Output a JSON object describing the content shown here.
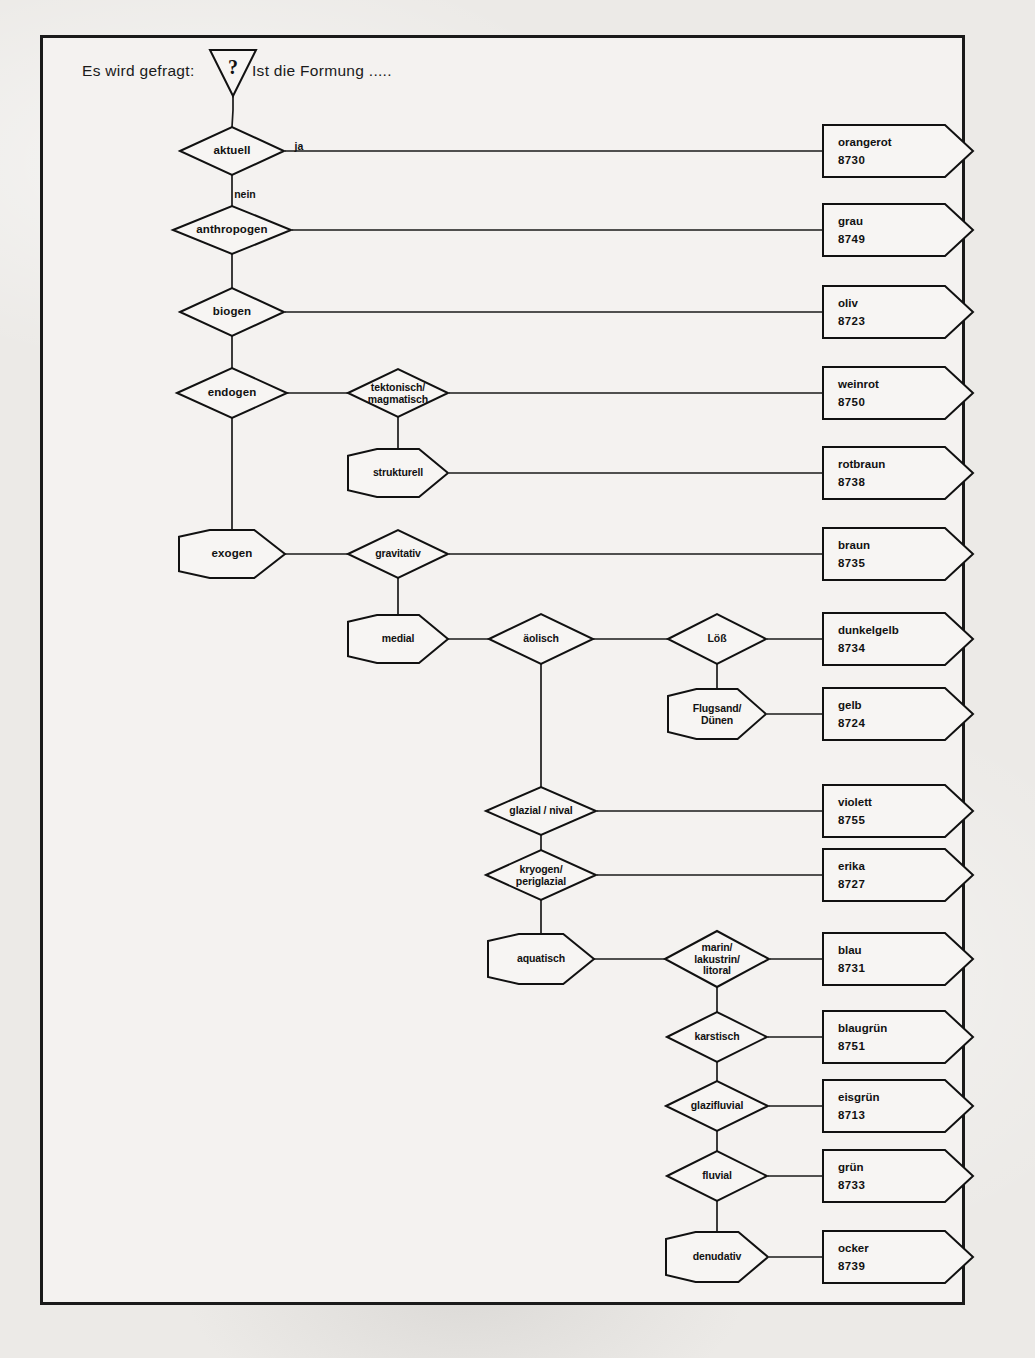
{
  "page": {
    "background": "#eceae7",
    "frame_color": "#1a1a1a",
    "ink_color": "#111111"
  },
  "header": {
    "prompt_left": "Es wird gefragt:",
    "question_glyph": "?",
    "question_icon": "question-mark-triangle",
    "prompt_right": "Ist die Formung ....."
  },
  "edge_labels": [
    {
      "text": "ja",
      "x": 299,
      "y": 146
    },
    {
      "text": "nein",
      "x": 245,
      "y": 194
    }
  ],
  "nodes": [
    {
      "id": "aktuell",
      "label": "aktuell",
      "shape": "diamond",
      "cx": 232,
      "cy": 151,
      "w": 104,
      "h": 48,
      "big": true
    },
    {
      "id": "anthropogen",
      "label": "anthropogen",
      "shape": "diamond",
      "cx": 232,
      "cy": 230,
      "w": 118,
      "h": 48,
      "big": true
    },
    {
      "id": "biogen",
      "label": "biogen",
      "shape": "diamond",
      "cx": 232,
      "cy": 312,
      "w": 104,
      "h": 48,
      "big": true
    },
    {
      "id": "endogen",
      "label": "endogen",
      "shape": "diamond",
      "cx": 232,
      "cy": 393,
      "w": 110,
      "h": 50,
      "big": true
    },
    {
      "id": "tektonisch",
      "label": "tektonisch/\nmagmatisch",
      "shape": "diamond",
      "cx": 398,
      "cy": 393,
      "w": 100,
      "h": 48,
      "big": false
    },
    {
      "id": "strukturell",
      "label": "strukturell",
      "shape": "hexagon",
      "cx": 398,
      "cy": 473,
      "w": 100,
      "h": 48,
      "big": false
    },
    {
      "id": "exogen",
      "label": "exogen",
      "shape": "hexagon",
      "cx": 232,
      "cy": 554,
      "w": 106,
      "h": 48,
      "big": true
    },
    {
      "id": "gravitativ",
      "label": "gravitativ",
      "shape": "diamond",
      "cx": 398,
      "cy": 554,
      "w": 100,
      "h": 48,
      "big": false
    },
    {
      "id": "medial",
      "label": "medial",
      "shape": "hexagon",
      "cx": 398,
      "cy": 639,
      "w": 100,
      "h": 48,
      "big": false
    },
    {
      "id": "aeolisch",
      "label": "äolisch",
      "shape": "diamond",
      "cx": 541,
      "cy": 639,
      "w": 104,
      "h": 50,
      "big": false
    },
    {
      "id": "loess",
      "label": "Löß",
      "shape": "diamond",
      "cx": 717,
      "cy": 639,
      "w": 98,
      "h": 50,
      "big": false
    },
    {
      "id": "flugsand",
      "label": "Flugsand/\nDünen",
      "shape": "hexagon",
      "cx": 717,
      "cy": 714,
      "w": 98,
      "h": 50,
      "big": false
    },
    {
      "id": "glazial",
      "label": "glazial / nival",
      "shape": "diamond",
      "cx": 541,
      "cy": 811,
      "w": 110,
      "h": 48,
      "big": false
    },
    {
      "id": "kryogen",
      "label": "kryogen/\nperiglazial",
      "shape": "diamond",
      "cx": 541,
      "cy": 875,
      "w": 110,
      "h": 50,
      "big": false
    },
    {
      "id": "aquatisch",
      "label": "aquatisch",
      "shape": "hexagon",
      "cx": 541,
      "cy": 959,
      "w": 106,
      "h": 50,
      "big": false
    },
    {
      "id": "marin",
      "label": "marin/\nlakustrin/\nlitoral",
      "shape": "diamond",
      "cx": 717,
      "cy": 959,
      "w": 104,
      "h": 56,
      "big": false
    },
    {
      "id": "karstisch",
      "label": "karstisch",
      "shape": "diamond",
      "cx": 717,
      "cy": 1037,
      "w": 100,
      "h": 50,
      "big": false
    },
    {
      "id": "glazifluvial",
      "label": "glazifluvial",
      "shape": "diamond",
      "cx": 717,
      "cy": 1106,
      "w": 102,
      "h": 50,
      "big": false
    },
    {
      "id": "fluvial",
      "label": "fluvial",
      "shape": "diamond",
      "cx": 717,
      "cy": 1176,
      "w": 100,
      "h": 50,
      "big": false
    },
    {
      "id": "denudativ",
      "label": "denudativ",
      "shape": "hexagon",
      "cx": 717,
      "cy": 1257,
      "w": 102,
      "h": 50,
      "big": false
    }
  ],
  "results": [
    {
      "id": "orangerot",
      "color_name": "orangerot",
      "code": "8730",
      "y": 151,
      "from_x": 285,
      "from_y": 151
    },
    {
      "id": "grau",
      "color_name": "grau",
      "code": "8749",
      "y": 230,
      "from_x": 292,
      "from_y": 230
    },
    {
      "id": "oliv",
      "color_name": "oliv",
      "code": "8723",
      "y": 312,
      "from_x": 285,
      "from_y": 312
    },
    {
      "id": "weinrot",
      "color_name": "weinrot",
      "code": "8750",
      "y": 393,
      "from_x": 449,
      "from_y": 393
    },
    {
      "id": "rotbraun",
      "color_name": "rotbraun",
      "code": "8738",
      "y": 473,
      "from_x": 449,
      "from_y": 473
    },
    {
      "id": "braun",
      "color_name": "braun",
      "code": "8735",
      "y": 554,
      "from_x": 449,
      "from_y": 554
    },
    {
      "id": "dunkelgelb",
      "color_name": "dunkelgelb",
      "code": "8734",
      "y": 639,
      "from_x": 767,
      "from_y": 639
    },
    {
      "id": "gelb",
      "color_name": "gelb",
      "code": "8724",
      "y": 714,
      "from_x": 767,
      "from_y": 714
    },
    {
      "id": "violett",
      "color_name": "violett",
      "code": "8755",
      "y": 811,
      "from_x": 597,
      "from_y": 811
    },
    {
      "id": "erika",
      "color_name": "erika",
      "code": "8727",
      "y": 875,
      "from_x": 597,
      "from_y": 875
    },
    {
      "id": "blau",
      "color_name": "blau",
      "code": "8731",
      "y": 959,
      "from_x": 770,
      "from_y": 959
    },
    {
      "id": "blaugruen",
      "color_name": "blaugrün",
      "code": "8751",
      "y": 1037,
      "from_x": 768,
      "from_y": 1037
    },
    {
      "id": "eisgruen",
      "color_name": "eisgrün",
      "code": "8713",
      "y": 1106,
      "from_x": 769,
      "from_y": 1106
    },
    {
      "id": "gruen",
      "color_name": "grün",
      "code": "8733",
      "y": 1176,
      "from_x": 768,
      "from_y": 1176
    },
    {
      "id": "ocker",
      "color_name": "ocker",
      "code": "8739",
      "y": 1257,
      "from_x": 769,
      "from_y": 1257
    }
  ],
  "result_box": {
    "left": 823,
    "width": 122,
    "height": 52,
    "tip": 28
  },
  "connections": [
    {
      "from": "question-triangle",
      "to": "aktuell",
      "type": "v"
    },
    {
      "from": "aktuell",
      "to": "anthropogen",
      "type": "v"
    },
    {
      "from": "anthropogen",
      "to": "biogen",
      "type": "v"
    },
    {
      "from": "biogen",
      "to": "endogen",
      "type": "v"
    },
    {
      "from": "endogen",
      "to": "exogen",
      "type": "v"
    },
    {
      "from": "endogen",
      "to": "tektonisch",
      "type": "h"
    },
    {
      "from": "tektonisch",
      "to": "strukturell",
      "type": "v"
    },
    {
      "from": "exogen",
      "to": "gravitativ",
      "type": "h"
    },
    {
      "from": "gravitativ",
      "to": "medial",
      "type": "v"
    },
    {
      "from": "medial",
      "to": "aeolisch",
      "type": "h"
    },
    {
      "from": "aeolisch",
      "to": "loess",
      "type": "h"
    },
    {
      "from": "loess",
      "to": "flugsand",
      "type": "v"
    },
    {
      "from": "aeolisch",
      "to": "glazial",
      "type": "v"
    },
    {
      "from": "glazial",
      "to": "kryogen",
      "type": "v"
    },
    {
      "from": "kryogen",
      "to": "aquatisch",
      "type": "v"
    },
    {
      "from": "aquatisch",
      "to": "marin",
      "type": "h"
    },
    {
      "from": "marin",
      "to": "karstisch",
      "type": "v"
    },
    {
      "from": "karstisch",
      "to": "glazifluvial",
      "type": "v"
    },
    {
      "from": "glazifluvial",
      "to": "fluvial",
      "type": "v"
    },
    {
      "from": "fluvial",
      "to": "denudativ",
      "type": "v"
    }
  ]
}
